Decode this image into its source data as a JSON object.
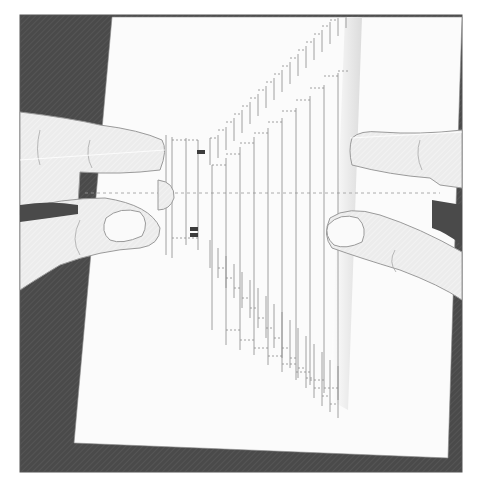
{
  "illustration": {
    "subject": "hands-pulling-popup-card",
    "description": "Two hands pulling apart a folded white card to reveal a stair-step pop-up cut pattern",
    "colors": {
      "background_dark": "#4a4a4a",
      "card": "#ffffff",
      "card_shadow": "#f2f2f2",
      "line": "#8a8a8a",
      "skin": "#ececec",
      "skin_outline": "#9a9a9a",
      "frame_border": "#555555",
      "accent_dark": "#3c3c3c"
    },
    "popup": {
      "left_steps": 14,
      "right_steps": 14
    }
  }
}
